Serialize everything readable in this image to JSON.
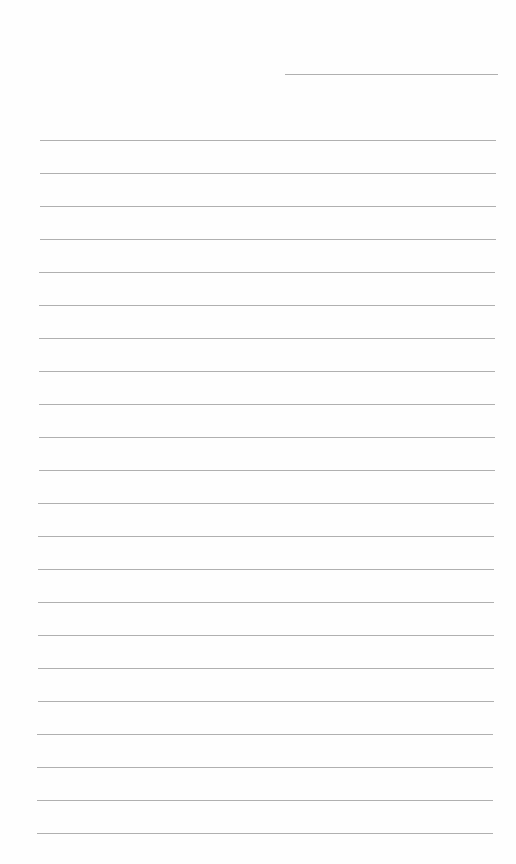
{
  "document": {
    "type": "lined-paper",
    "background_color": "#fefefe",
    "line_color": "#b0b0b0",
    "header_line": {
      "label": "",
      "x": 285,
      "y": 74,
      "width": 213
    },
    "ruled_lines": {
      "count": 22,
      "first_y": 140,
      "spacing": 33,
      "x_start": 40,
      "x_end": 496,
      "lines": [
        {
          "text": ""
        },
        {
          "text": ""
        },
        {
          "text": ""
        },
        {
          "text": ""
        },
        {
          "text": ""
        },
        {
          "text": ""
        },
        {
          "text": ""
        },
        {
          "text": ""
        },
        {
          "text": ""
        },
        {
          "text": ""
        },
        {
          "text": ""
        },
        {
          "text": ""
        },
        {
          "text": ""
        },
        {
          "text": ""
        },
        {
          "text": ""
        },
        {
          "text": ""
        },
        {
          "text": ""
        },
        {
          "text": ""
        },
        {
          "text": ""
        },
        {
          "text": ""
        },
        {
          "text": ""
        },
        {
          "text": ""
        }
      ]
    }
  }
}
